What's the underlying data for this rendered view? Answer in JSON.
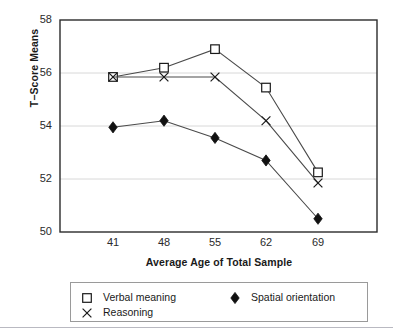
{
  "figure": {
    "title_fragment": "",
    "axis_title_y": "T−Score Means",
    "axis_title_x": "Average Age of Total Sample"
  },
  "legend": {
    "entries": [
      {
        "label": "Verbal meaning",
        "marker": "open-square",
        "color": "#1a1a1a"
      },
      {
        "label": "Reasoning",
        "marker": "cross-x",
        "color": "#1a1a1a"
      },
      {
        "label": "Spatial orientation",
        "marker": "filled-diamond",
        "color": "#111111"
      }
    ]
  },
  "chart_data": {
    "type": "line",
    "title": "",
    "xlabel": "Average Age of Total Sample",
    "ylabel": "T−Score Means",
    "categories": [
      "41",
      "48",
      "55",
      "62",
      "69"
    ],
    "x": [
      41,
      48,
      55,
      62,
      69
    ],
    "ylim": [
      50,
      58
    ],
    "yticks": [
      50,
      52,
      54,
      56,
      58
    ],
    "ytick_labels": [
      "50",
      "52",
      "54",
      "56",
      "58"
    ],
    "xtick_labels": [
      "41",
      "48",
      "55",
      "62",
      "69"
    ],
    "grid": "horizontal",
    "grid_values": [
      52,
      54,
      56
    ],
    "legend_position": "below",
    "series": [
      {
        "name": "Verbal meaning",
        "marker": "open-square",
        "values": [
          55.85,
          56.2,
          56.9,
          55.45,
          52.25
        ]
      },
      {
        "name": "Reasoning",
        "marker": "cross-x",
        "values": [
          55.85,
          55.85,
          55.85,
          54.2,
          51.85
        ]
      },
      {
        "name": "Spatial orientation",
        "marker": "filled-diamond",
        "values": [
          53.95,
          54.2,
          53.55,
          52.7,
          50.5
        ]
      }
    ]
  },
  "colors": {
    "line": "#4a4a4a",
    "marker_stroke": "#1a1a1a",
    "marker_fill_solid": "#111111",
    "frame": "#2b2b2b",
    "grid": "#d8d8d8",
    "text": "#1a1a1a"
  }
}
